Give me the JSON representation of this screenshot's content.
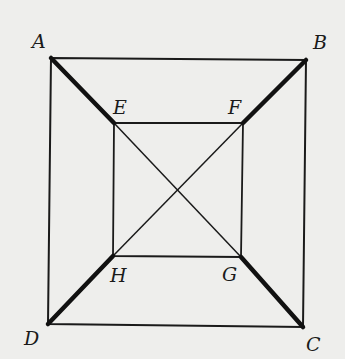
{
  "diagram": {
    "type": "geometry",
    "points": {
      "A": {
        "label": "A",
        "x": 51,
        "y": 58,
        "lx": 32,
        "ly": 48
      },
      "B": {
        "label": "B",
        "x": 306,
        "y": 60,
        "lx": 313,
        "ly": 49
      },
      "C": {
        "label": "C",
        "x": 303,
        "y": 327,
        "lx": 306,
        "ly": 351
      },
      "D": {
        "label": "D",
        "x": 48,
        "y": 324,
        "lx": 24,
        "ly": 345
      },
      "E": {
        "label": "E",
        "x": 114,
        "y": 123,
        "lx": 113,
        "ly": 114
      },
      "F": {
        "label": "F",
        "x": 243,
        "y": 123,
        "lx": 228,
        "ly": 114
      },
      "G": {
        "label": "G",
        "x": 241,
        "y": 257,
        "lx": 222,
        "ly": 281
      },
      "H": {
        "label": "H",
        "x": 113,
        "y": 256,
        "lx": 110,
        "ly": 282
      }
    },
    "thick_segments": [
      "AE",
      "BF",
      "CG",
      "DH"
    ],
    "thin_segments": [
      "AB",
      "BC",
      "CD",
      "DA",
      "EF",
      "FG",
      "GH",
      "HE",
      "EG",
      "FH"
    ]
  }
}
